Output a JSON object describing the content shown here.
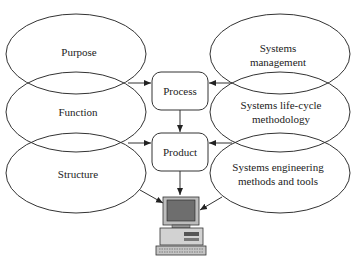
{
  "diagram": {
    "left_ellipses": [
      {
        "label": [
          "Purpose"
        ]
      },
      {
        "label": [
          "Function"
        ]
      },
      {
        "label": [
          "Structure"
        ]
      }
    ],
    "right_ellipses": [
      {
        "label": [
          "Systems",
          "management"
        ]
      },
      {
        "label": [
          "Systems life-cycle",
          "methodology"
        ]
      },
      {
        "label": [
          "Systems engineering",
          "methods and tools"
        ]
      }
    ],
    "boxes": {
      "process": "Process",
      "product": "Product"
    },
    "computer": "computer-icon"
  },
  "colors": {
    "stroke": "#333333",
    "background": "#ffffff",
    "computer_body": "#c8c8c8",
    "computer_screen": "#6a6a6a"
  }
}
